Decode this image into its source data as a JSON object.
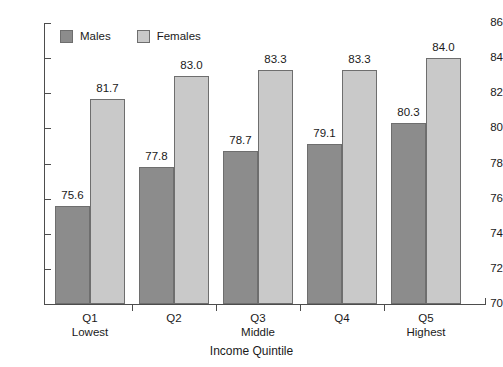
{
  "chart_data": {
    "type": "bar",
    "title": "",
    "subtitle": "",
    "xlabel": "Income Quintile",
    "ylabel": "",
    "ylim": [
      70,
      86
    ],
    "ytick_step": 2,
    "yticks": [
      70,
      72,
      74,
      76,
      78,
      80,
      82,
      84,
      86
    ],
    "ytick_labels": [
      "70",
      "72",
      "74",
      "76",
      "78",
      "80",
      "82",
      "84",
      "86"
    ],
    "grid": false,
    "legend_position": "top-left-inside",
    "categories": [
      "Q1",
      "Q2",
      "Q3",
      "Q4",
      "Q5"
    ],
    "category_sublabels": [
      "Lowest",
      "",
      "Middle",
      "",
      "Highest"
    ],
    "series": [
      {
        "name": "Males",
        "color": "#8c8c8c",
        "values": [
          75.6,
          77.8,
          78.7,
          79.1,
          80.3
        ],
        "value_labels": [
          "75.6",
          "77.8",
          "78.7",
          "79.1",
          "80.3"
        ]
      },
      {
        "name": "Females",
        "color": "#c9c9c9",
        "values": [
          81.7,
          83.0,
          83.3,
          83.3,
          84.0
        ],
        "value_labels": [
          "81.7",
          "83.0",
          "83.3",
          "83.3",
          "84.0"
        ]
      }
    ]
  },
  "legend": {
    "items": [
      {
        "label": "Males",
        "color": "#8c8c8c"
      },
      {
        "label": "Females",
        "color": "#c9c9c9"
      }
    ]
  },
  "axes": {
    "x_title": "Income Quintile",
    "axis_color": "#4d4d4d"
  }
}
